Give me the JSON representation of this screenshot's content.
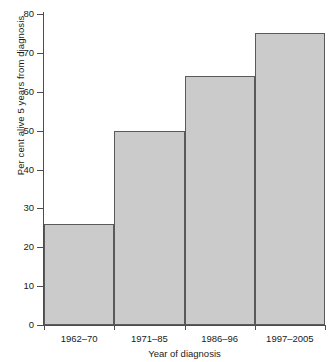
{
  "chart_data": {
    "type": "bar",
    "title": "",
    "categories": [
      "1962–70",
      "1971–85",
      "1986–96",
      "1997–2005"
    ],
    "values": [
      26,
      50,
      64,
      75
    ],
    "xlabel": "Year of diagnosis",
    "ylabel": "Per cent alive 5 years from diagnosis",
    "ylim": [
      0,
      80
    ],
    "yticks": [
      0,
      10,
      20,
      30,
      40,
      50,
      60,
      70,
      80
    ],
    "ytick_labels": [
      "0",
      "10",
      "20",
      "30",
      "40",
      "50",
      "60",
      "70",
      "80"
    ],
    "grid": false,
    "legend": false,
    "bar_fill_color": "#cbcbcb",
    "bar_edge_color": "#5a5a5a",
    "axis_color": "#4d4d4d",
    "background_color": "#ffffff"
  }
}
